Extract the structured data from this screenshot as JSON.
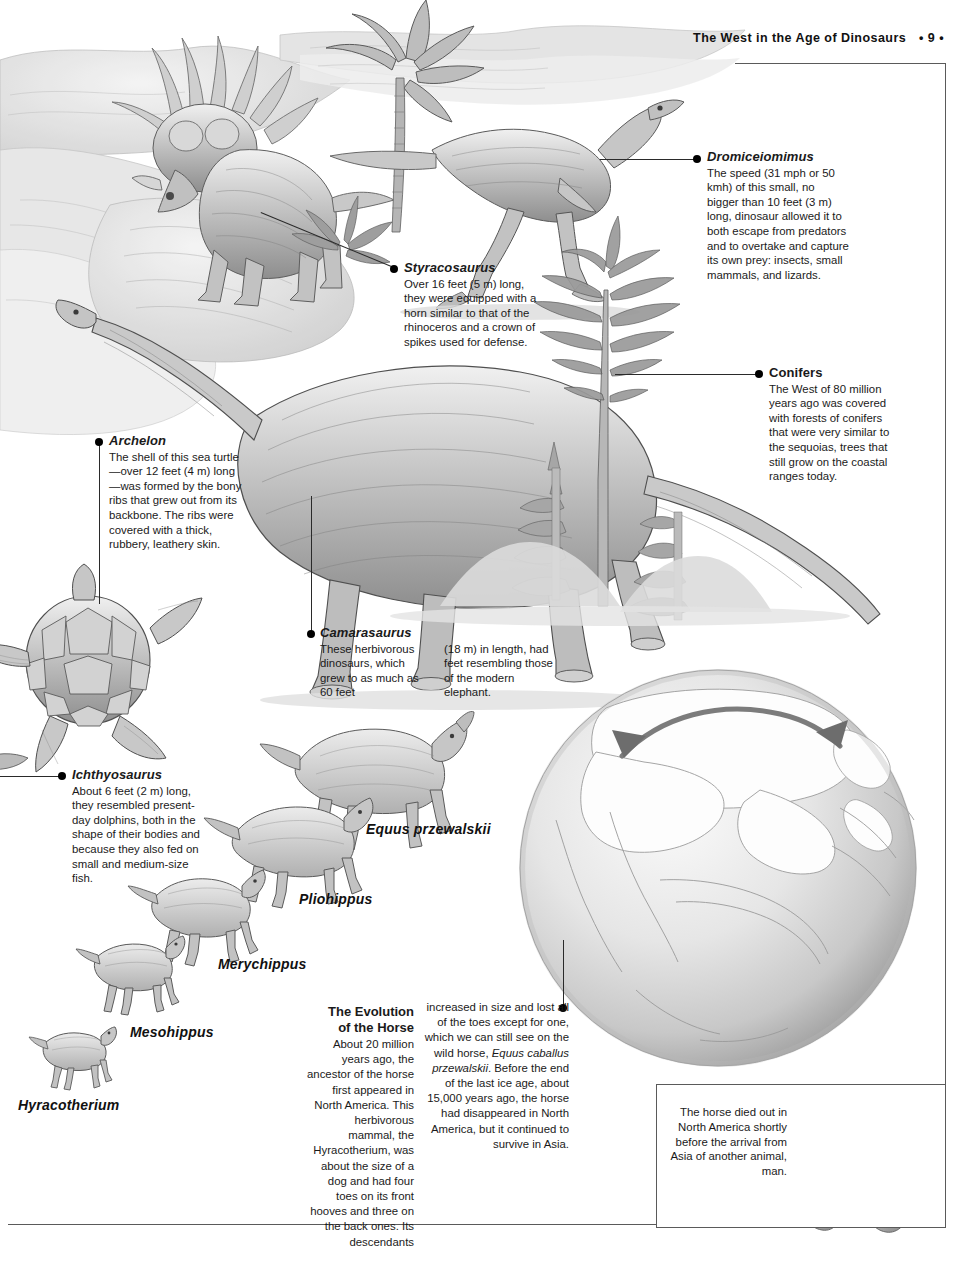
{
  "page": {
    "header_title": "The West in the Age of Dinosaurs",
    "page_number": "• 9 •"
  },
  "callouts": [
    {
      "id": "dromiceiomimus",
      "title": "Dromiceiomimus",
      "title_style": "italic",
      "body": "The speed (31 mph or 50 kmh) of this small, no bigger than 10 feet (3 m) long, dinosaur allowed it to both escape from predators and to overtake and capture its own prey: insects, small mammals, and lizards."
    },
    {
      "id": "styracosaurus",
      "title": "Styracosaurus",
      "title_style": "italic",
      "body": "Over 16 feet (5 m) long, they were equipped with a horn similar to that of the rhinoceros and a crown of spikes used for defense."
    },
    {
      "id": "conifers",
      "title": "Conifers",
      "title_style": "roman",
      "body": "The West of 80 million years ago was covered with forests of conifers that were very similar to the sequoias, trees that still grow on the coastal ranges today."
    },
    {
      "id": "archelon",
      "title": "Archelon",
      "title_style": "italic",
      "body": "The shell of this sea turtle—over 12 feet (4 m) long—was formed by the bony ribs that grew out from its backbone. The ribs were covered with a thick, rubbery, leathery skin."
    },
    {
      "id": "camarasaurus",
      "title": "Camarasaurus",
      "title_style": "italic",
      "body_col1": "These herbivorous dinosaurs, which grew to as much as 60 feet",
      "body_col2": "(18 m) in length, had feet resembling those of the modern elephant."
    },
    {
      "id": "ichthyosaurus",
      "title": "Ichthyosaurus",
      "title_style": "italic",
      "body": "About 6 feet (2 m) long, they resembled present-day dolphins, both in the shape of their bodies and because they also fed on small and medium-size fish."
    }
  ],
  "horse_evolution": {
    "labels": [
      {
        "name": "Equus przewalskii"
      },
      {
        "name": "Pliohippus"
      },
      {
        "name": "Merychippus"
      },
      {
        "name": "Mesohippus"
      },
      {
        "name": "Hyracotherium"
      }
    ],
    "essay_heading_line1": "The Evolution",
    "essay_heading_line2": "of the Horse",
    "essay_col1": "About 20 million years ago, the ancestor of the horse first appeared in North America. This herbivorous mammal, the Hyracotherium, was about the size of a dog and had four toes on its front hooves and three on the back ones. Its descendants",
    "essay_col1_italic_word": "Hyracotherium",
    "essay_col2_a": "increased in size and lost all of the toes except for one, which we can still see on the wild horse,",
    "essay_col2_italic": "Equus caballus przewalskii",
    "essay_col2_b": ". Before the end of the last ice age, about 15,000 years ago, the horse had disappeared in North America, but it continued to survive in Asia."
  },
  "artifact_panel": {
    "caption": "The horse died out in North America shortly before the arrival from Asia of another animal, man."
  },
  "colors": {
    "rule": "#5a5a5a",
    "text": "#1a1a1a",
    "dot": "#000000"
  }
}
